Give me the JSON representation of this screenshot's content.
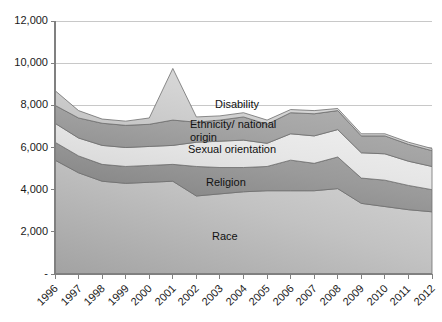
{
  "chart_data": {
    "type": "area",
    "stacked": true,
    "title": "",
    "subtitle": "",
    "xlabel": "",
    "ylabel": "",
    "grid": true,
    "legend_position": "inline-labels",
    "ylim": [
      0,
      12000
    ],
    "xlim": [
      "1996",
      "2012"
    ],
    "ytick_labels": [
      "12,000",
      "10,000",
      "8,000",
      "6,000",
      "4,000",
      "2,000",
      "-"
    ],
    "ytick_values": [
      12000,
      10000,
      8000,
      6000,
      4000,
      2000,
      0
    ],
    "categories": [
      "1996",
      "1997",
      "1998",
      "1999",
      "2000",
      "2001",
      "2002",
      "2003",
      "2004",
      "2005",
      "2006",
      "2007",
      "2008",
      "2009",
      "2010",
      "2011",
      "2012"
    ],
    "series": [
      {
        "name": "Race",
        "color": "#b9b9b9",
        "values": [
          5400,
          4800,
          4400,
          4300,
          4350,
          4400,
          3700,
          3800,
          3900,
          3950,
          3950,
          3950,
          4050,
          3350,
          3200,
          3050,
          2950
        ]
      },
      {
        "name": "Religion",
        "color": "#8f8f8f",
        "values": [
          850,
          800,
          800,
          800,
          800,
          800,
          1400,
          1250,
          1150,
          1150,
          1450,
          1300,
          1500,
          1200,
          1250,
          1150,
          1050
        ]
      },
      {
        "name": "Sexual orientation",
        "color": "#e0e0e0",
        "values": [
          900,
          850,
          900,
          900,
          900,
          900,
          1150,
          1250,
          1300,
          1100,
          1250,
          1300,
          1300,
          1200,
          1250,
          1150,
          1100
        ]
      },
      {
        "name": "Ethnicity/\nnational origin",
        "color": "#9e9e9e",
        "values": [
          850,
          950,
          1050,
          1050,
          1050,
          1200,
          950,
          1000,
          1100,
          900,
          1000,
          1050,
          900,
          800,
          850,
          800,
          750
        ]
      },
      {
        "name": "Disability",
        "color": "#cccccc",
        "values": [
          700,
          350,
          200,
          200,
          300,
          2450,
          250,
          200,
          200,
          200,
          150,
          150,
          100,
          100,
          100,
          100,
          100
        ]
      }
    ],
    "cumulative_tops": {
      "1996": [
        5400,
        6250,
        7150,
        8000,
        8700
      ],
      "1997": [
        4800,
        5600,
        6450,
        7400,
        7750
      ],
      "1998": [
        4400,
        5200,
        6100,
        7150,
        7350
      ],
      "1999": [
        4300,
        5100,
        6000,
        7050,
        7250
      ],
      "2000": [
        4350,
        5150,
        6050,
        7100,
        7400
      ],
      "2001": [
        4400,
        5200,
        6100,
        7300,
        9750
      ],
      "2002": [
        3700,
        5100,
        6250,
        7200,
        7450
      ],
      "2003": [
        3800,
        5050,
        6300,
        7300,
        7500
      ],
      "2004": [
        3900,
        5050,
        6350,
        7450,
        7650
      ],
      "2005": [
        3950,
        5100,
        6200,
        7100,
        7300
      ],
      "2006": [
        3950,
        5400,
        6650,
        7650,
        7800
      ],
      "2007": [
        3950,
        5250,
        6550,
        7600,
        7750
      ],
      "2008": [
        4050,
        5550,
        6850,
        7750,
        7850
      ],
      "2009": [
        3350,
        4550,
        5750,
        6550,
        6650
      ],
      "2010": [
        3200,
        4450,
        5700,
        6550,
        6650
      ],
      "2011": [
        3050,
        4200,
        5350,
        6150,
        6250
      ],
      "2012": [
        2950,
        4000,
        5100,
        5850,
        5950
      ]
    },
    "series_label_positions": [
      {
        "name": "Disability",
        "x": 215,
        "y": 98
      },
      {
        "name": "Ethnicity/ national origin",
        "x": 190,
        "y": 118
      },
      {
        "name": "Sexual orientation",
        "x": 188,
        "y": 143
      },
      {
        "name": "Religion",
        "x": 206,
        "y": 176
      },
      {
        "name": "Race",
        "x": 212,
        "y": 230
      }
    ]
  },
  "axis": {
    "line_color": "#808080",
    "grid_color": "#c8c8c8",
    "tick_color": "#808080"
  }
}
